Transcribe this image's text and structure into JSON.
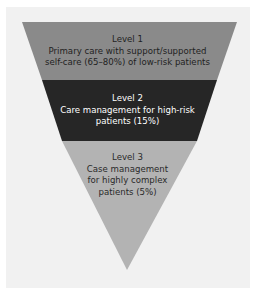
{
  "diagram": {
    "type": "inverted-pyramid",
    "background_color": "#f1f1f1",
    "levels": [
      {
        "title": "Level 1",
        "lines": [
          "Primary care with support/supported",
          "self-care (65–80%) of low-risk patients"
        ],
        "color": "#8a8a8a",
        "text_color": "#1f1f1f"
      },
      {
        "title": "Level 2",
        "lines": [
          "Care management for high-risk",
          "patients (15%)"
        ],
        "color": "#262626",
        "text_color": "#ffffff"
      },
      {
        "title": "Level 3",
        "lines": [
          "Case management",
          "for highly complex",
          "patients (5%)"
        ],
        "color": "#b3b3b3",
        "text_color": "#2a2a2a"
      }
    ]
  }
}
